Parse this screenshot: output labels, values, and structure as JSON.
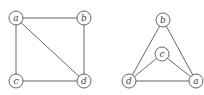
{
  "graphs": [
    {
      "name": "square-graph",
      "nodes": [
        {
          "id": "a",
          "label": "a",
          "x": 16,
          "y": 18
        },
        {
          "id": "b",
          "label": "b",
          "x": 84,
          "y": 18
        },
        {
          "id": "c",
          "label": "c",
          "x": 16,
          "y": 81
        },
        {
          "id": "d",
          "label": "d",
          "x": 84,
          "y": 81
        }
      ],
      "edges": [
        [
          "a",
          "b"
        ],
        [
          "a",
          "c"
        ],
        [
          "a",
          "d"
        ],
        [
          "b",
          "d"
        ],
        [
          "c",
          "d"
        ]
      ]
    },
    {
      "name": "triangle-graph",
      "nodes": [
        {
          "id": "b",
          "label": "b",
          "x": 163,
          "y": 20
        },
        {
          "id": "c",
          "label": "c",
          "x": 162,
          "y": 54
        },
        {
          "id": "d",
          "label": "d",
          "x": 129,
          "y": 81
        },
        {
          "id": "a",
          "label": "a",
          "x": 196,
          "y": 81
        }
      ],
      "edges": [
        [
          "b",
          "d"
        ],
        [
          "b",
          "a"
        ],
        [
          "c",
          "d"
        ],
        [
          "c",
          "a"
        ],
        [
          "d",
          "a"
        ]
      ]
    }
  ],
  "style": {
    "node_radius": 7,
    "stroke_color": "#555555"
  }
}
